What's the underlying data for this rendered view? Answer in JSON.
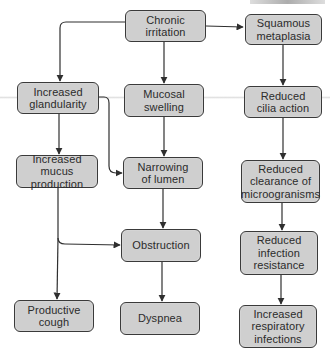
{
  "diagram": {
    "colors": {
      "node_fill": "#cfcfcf",
      "node_border": "#3a3a3a",
      "text": "#2b2b2b",
      "edge": "#2f2f2f"
    },
    "nodes": {
      "chronic_irritation": "Chronic\nirritation",
      "squamous_metaplasia": "Squamous\nmetaplasia",
      "increased_glandularity": "Increased\nglandularity",
      "mucosal_swelling": "Mucosal\nswelling",
      "reduced_cilia_action": "Reduced\ncilia action",
      "increased_mucus_production": "Increased mucus\nproduction",
      "narrowing_of_lumen": "Narrowing\nof lumen",
      "reduced_clearance": "Reduced\nclearance of\nmicroogranisms",
      "obstruction": "Obstruction",
      "reduced_infection_resistance": "Reduced\ninfection\nresistance",
      "productive_cough": "Productive\ncough",
      "dyspnea": "Dyspnea",
      "increased_respiratory_infections": "Increased\nrespiratory\ninfections"
    },
    "edges": [
      {
        "from": "chronic_irritation",
        "to": "squamous_metaplasia"
      },
      {
        "from": "chronic_irritation",
        "to": "increased_glandularity"
      },
      {
        "from": "chronic_irritation",
        "to": "mucosal_swelling"
      },
      {
        "from": "squamous_metaplasia",
        "to": "reduced_cilia_action"
      },
      {
        "from": "increased_glandularity",
        "to": "increased_mucus_production"
      },
      {
        "from": "increased_glandularity",
        "to": "narrowing_of_lumen"
      },
      {
        "from": "mucosal_swelling",
        "to": "narrowing_of_lumen"
      },
      {
        "from": "reduced_cilia_action",
        "to": "reduced_clearance"
      },
      {
        "from": "increased_mucus_production",
        "to": "obstruction"
      },
      {
        "from": "increased_mucus_production",
        "to": "productive_cough"
      },
      {
        "from": "narrowing_of_lumen",
        "to": "obstruction"
      },
      {
        "from": "reduced_clearance",
        "to": "reduced_infection_resistance"
      },
      {
        "from": "obstruction",
        "to": "dyspnea"
      },
      {
        "from": "reduced_infection_resistance",
        "to": "increased_respiratory_infections"
      }
    ]
  }
}
